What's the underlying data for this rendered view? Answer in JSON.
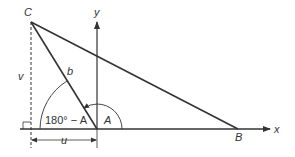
{
  "diagram": {
    "type": "geometry-triangle-coordinate",
    "colors": {
      "line": "#333333",
      "background": "#ffffff"
    },
    "vertices": {
      "C": {
        "label": "C"
      },
      "A": {
        "label": "A"
      },
      "B": {
        "label": "B"
      }
    },
    "axes": {
      "x_label": "x",
      "y_label": "y"
    },
    "labels": {
      "side_b": "b",
      "height_v": "v",
      "base_u": "u",
      "angle_A": "A",
      "angle_supplement": "180° − A"
    }
  }
}
